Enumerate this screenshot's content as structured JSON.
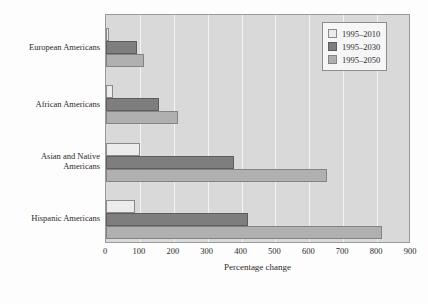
{
  "chart_data": {
    "type": "bar",
    "orientation": "horizontal",
    "title": "",
    "xlabel": "Percentage change",
    "ylabel": "",
    "xlim": [
      0,
      900
    ],
    "xticks": [
      "0",
      "100",
      "200",
      "300",
      "400",
      "500",
      "600",
      "700",
      "800",
      "900"
    ],
    "grid": true,
    "legend_position": "top-right",
    "categories": [
      "European Americans",
      "African Americans",
      "Asian and Native\nAmericans",
      "Hispanic Americans"
    ],
    "series": [
      {
        "name": "1995–2010",
        "color": "#ececec",
        "values": [
          8,
          22,
          100,
          85
        ]
      },
      {
        "name": "1995–2030",
        "color": "#7e7e7e",
        "values": [
          90,
          155,
          378,
          420
        ]
      },
      {
        "name": "1995–2050",
        "color": "#b0b0b0",
        "values": [
          112,
          213,
          652,
          815
        ]
      }
    ]
  },
  "colors": {
    "plot_background": "#d9d9d9",
    "gridline": "#f4f4f4",
    "axis": "#9a9a9a",
    "text": "#2b2b2b",
    "series_1995_2010": "#ececec",
    "series_1995_2030": "#7e7e7e",
    "series_1995_2050": "#b0b0b0"
  }
}
